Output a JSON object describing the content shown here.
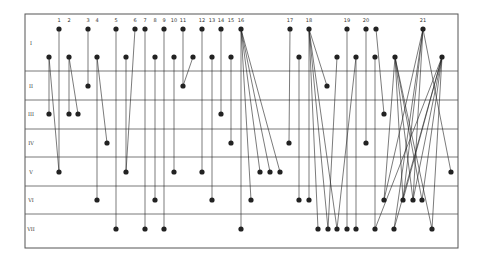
{
  "diagram": {
    "frame": {
      "left": 25,
      "right": 458,
      "top": 14,
      "bottom": 248
    },
    "row_lines_y": [
      71,
      100,
      129,
      157,
      186,
      214
    ],
    "rows": [
      {
        "label": "I",
        "y": 43
      },
      {
        "label": "II",
        "y": 86
      },
      {
        "label": "III",
        "y": 114
      },
      {
        "label": "IV",
        "y": 143
      },
      {
        "label": "V",
        "y": 172
      },
      {
        "label": "VI",
        "y": 200
      },
      {
        "label": "VII",
        "y": 229
      }
    ],
    "columns": [
      {
        "label": "1",
        "x": 59
      },
      {
        "label": "2",
        "x": 69
      },
      {
        "label": "3",
        "x": 88
      },
      {
        "label": "4",
        "x": 97
      },
      {
        "label": "5",
        "x": 116
      },
      {
        "label": "6",
        "x": 135
      },
      {
        "label": "7",
        "x": 145
      },
      {
        "label": "8",
        "x": 155
      },
      {
        "label": "9",
        "x": 164
      },
      {
        "label": "10",
        "x": 174
      },
      {
        "label": "11",
        "x": 183
      },
      {
        "label": "12",
        "x": 202
      },
      {
        "label": "13",
        "x": 212
      },
      {
        "label": "14",
        "x": 221
      },
      {
        "label": "15",
        "x": 231
      },
      {
        "label": "16",
        "x": 241
      },
      {
        "label": "17",
        "x": 290
      },
      {
        "label": "18",
        "x": 309
      },
      {
        "label": "19",
        "x": 347
      },
      {
        "label": "20",
        "x": 366
      },
      {
        "label": "21",
        "x": 423
      }
    ],
    "edges": [
      [
        59,
        29,
        59,
        172
      ],
      [
        49,
        57,
        49,
        114
      ],
      [
        49,
        57,
        59,
        172
      ],
      [
        69,
        57,
        69,
        114
      ],
      [
        69,
        57,
        78,
        114
      ],
      [
        88,
        29,
        88,
        86
      ],
      [
        97,
        57,
        97,
        200
      ],
      [
        97,
        57,
        107,
        143
      ],
      [
        116,
        29,
        116,
        229
      ],
      [
        126,
        57,
        126,
        172
      ],
      [
        135,
        29,
        126,
        172
      ],
      [
        145,
        29,
        145,
        229
      ],
      [
        155,
        57,
        155,
        200
      ],
      [
        164,
        29,
        164,
        229
      ],
      [
        174,
        57,
        174,
        172
      ],
      [
        183,
        29,
        183,
        86
      ],
      [
        193,
        57,
        183,
        86
      ],
      [
        202,
        29,
        202,
        172
      ],
      [
        212,
        57,
        212,
        200
      ],
      [
        221,
        29,
        221,
        114
      ],
      [
        231,
        57,
        231,
        143
      ],
      [
        241,
        29,
        241,
        229
      ],
      [
        241,
        29,
        251,
        200
      ],
      [
        241,
        29,
        260,
        172
      ],
      [
        241,
        29,
        270,
        172
      ],
      [
        241,
        29,
        280,
        172
      ],
      [
        290,
        29,
        289,
        143
      ],
      [
        299,
        57,
        299,
        200
      ],
      [
        309,
        29,
        309,
        200
      ],
      [
        309,
        29,
        318,
        229
      ],
      [
        309,
        29,
        327,
        86
      ],
      [
        309,
        29,
        328,
        229
      ],
      [
        309,
        29,
        337,
        229
      ],
      [
        337,
        57,
        328,
        229
      ],
      [
        347,
        29,
        347,
        229
      ],
      [
        356,
        57,
        356,
        229
      ],
      [
        356,
        57,
        337,
        229
      ],
      [
        366,
        29,
        366,
        143
      ],
      [
        376,
        29,
        384,
        114
      ],
      [
        375,
        57,
        375,
        229
      ],
      [
        395,
        57,
        384,
        200
      ],
      [
        395,
        57,
        403,
        200
      ],
      [
        395,
        57,
        413,
        200
      ],
      [
        395,
        57,
        422,
        200
      ],
      [
        395,
        57,
        432,
        229
      ],
      [
        423,
        29,
        384,
        200
      ],
      [
        423,
        29,
        394,
        229
      ],
      [
        423,
        29,
        403,
        200
      ],
      [
        423,
        29,
        413,
        200
      ],
      [
        423,
        29,
        451,
        172
      ],
      [
        442,
        57,
        394,
        229
      ],
      [
        442,
        57,
        403,
        200
      ],
      [
        442,
        57,
        413,
        200
      ],
      [
        442,
        57,
        422,
        200
      ],
      [
        442,
        57,
        375,
        229
      ],
      [
        442,
        57,
        432,
        229
      ]
    ],
    "nodes": [
      [
        59,
        29
      ],
      [
        88,
        29
      ],
      [
        116,
        29
      ],
      [
        135,
        29
      ],
      [
        145,
        29
      ],
      [
        164,
        29
      ],
      [
        183,
        29
      ],
      [
        202,
        29
      ],
      [
        221,
        29
      ],
      [
        241,
        29
      ],
      [
        290,
        29
      ],
      [
        309,
        29
      ],
      [
        347,
        29
      ],
      [
        366,
        29
      ],
      [
        376,
        29
      ],
      [
        423,
        29
      ],
      [
        49,
        57
      ],
      [
        69,
        57
      ],
      [
        97,
        57
      ],
      [
        126,
        57
      ],
      [
        155,
        57
      ],
      [
        174,
        57
      ],
      [
        193,
        57
      ],
      [
        212,
        57
      ],
      [
        231,
        57
      ],
      [
        299,
        57
      ],
      [
        337,
        57
      ],
      [
        356,
        57
      ],
      [
        375,
        57
      ],
      [
        395,
        57
      ],
      [
        442,
        57
      ],
      [
        88,
        86
      ],
      [
        183,
        86
      ],
      [
        327,
        86
      ],
      [
        49,
        114
      ],
      [
        69,
        114
      ],
      [
        78,
        114
      ],
      [
        221,
        114
      ],
      [
        384,
        114
      ],
      [
        107,
        143
      ],
      [
        231,
        143
      ],
      [
        289,
        143
      ],
      [
        366,
        143
      ],
      [
        59,
        172
      ],
      [
        126,
        172
      ],
      [
        174,
        172
      ],
      [
        202,
        172
      ],
      [
        260,
        172
      ],
      [
        270,
        172
      ],
      [
        280,
        172
      ],
      [
        451,
        172
      ],
      [
        97,
        200
      ],
      [
        155,
        200
      ],
      [
        212,
        200
      ],
      [
        251,
        200
      ],
      [
        299,
        200
      ],
      [
        309,
        200
      ],
      [
        384,
        200
      ],
      [
        403,
        200
      ],
      [
        413,
        200
      ],
      [
        422,
        200
      ],
      [
        116,
        229
      ],
      [
        145,
        229
      ],
      [
        164,
        229
      ],
      [
        241,
        229
      ],
      [
        318,
        229
      ],
      [
        328,
        229
      ],
      [
        337,
        229
      ],
      [
        347,
        229
      ],
      [
        356,
        229
      ],
      [
        375,
        229
      ],
      [
        394,
        229
      ],
      [
        432,
        229
      ]
    ],
    "colors": {
      "ink": "#222222",
      "grid": "#555555",
      "background": "#ffffff"
    }
  }
}
